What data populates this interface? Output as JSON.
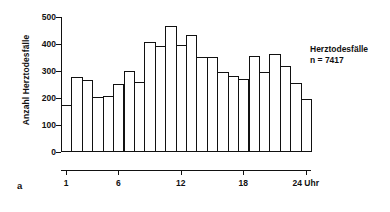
{
  "panel_label": "a",
  "annotation": {
    "line1": "Herztodesfälle",
    "line2": "n = 7417"
  },
  "axes": {
    "ylabel": "Anzahl Herztodesfälle",
    "xlabel_suffix": "Uhr"
  },
  "chart_data": {
    "type": "bar",
    "title": "",
    "subtitle": "",
    "xlabel": "",
    "ylabel": "Anzahl Herztodesfälle",
    "xlim": [
      0,
      24
    ],
    "ylim": [
      0,
      500
    ],
    "grid": false,
    "legend": null,
    "annotations": [
      "Herztodesfälle",
      "n = 7417"
    ],
    "ytick_values": [
      0,
      100,
      200,
      300,
      400,
      500
    ],
    "ytick_labels": [
      "0",
      "100",
      "200",
      "300",
      "400",
      "500"
    ],
    "xtick_values": [
      1,
      6,
      12,
      18,
      24
    ],
    "xtick_labels": [
      "1",
      "6",
      "12",
      "18",
      "24 Uhr"
    ],
    "categories": [
      "1",
      "2",
      "3",
      "4",
      "5",
      "6",
      "7",
      "8",
      "9",
      "10",
      "11",
      "12",
      "13",
      "14",
      "15",
      "16",
      "17",
      "18",
      "19",
      "20",
      "21",
      "22",
      "23",
      "24"
    ],
    "values": [
      175,
      278,
      265,
      205,
      207,
      252,
      300,
      258,
      407,
      393,
      466,
      397,
      435,
      352,
      352,
      297,
      280,
      270,
      355,
      297,
      362,
      320,
      255,
      195
    ]
  }
}
